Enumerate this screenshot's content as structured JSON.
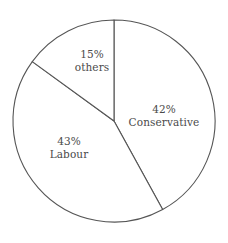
{
  "chart_data": {
    "type": "pie",
    "title": "",
    "subtitle": "",
    "xlabel": "",
    "ylabel": "",
    "legend_position": "none",
    "grid": false,
    "total": 100,
    "units": "percent",
    "start_angle_deg": 0,
    "direction": "clockwise",
    "geometry": {
      "center_x": 114,
      "center_y": 121,
      "radius": 101
    },
    "style": {
      "slice_fill": "#ffffff",
      "slice_stroke": "#555555",
      "label_color": "#4a4a4a",
      "background": "#ffffff"
    },
    "categories": [
      "Conservative",
      "Labour",
      "others"
    ],
    "values": [
      42,
      43,
      15
    ],
    "slices": [
      {
        "name": "Conservative",
        "value": 42,
        "percent_label": "42%",
        "label_line1": "42%",
        "label_line2": "Conservative",
        "start_deg": 0,
        "end_deg": 151.2,
        "label_x": 164,
        "label_y": 115
      },
      {
        "name": "Labour",
        "value": 43,
        "percent_label": "43%",
        "label_line1": "43%",
        "label_line2": "Labour",
        "start_deg": 151.2,
        "end_deg": 306.0,
        "label_x": 69,
        "label_y": 147
      },
      {
        "name": "others",
        "value": 15,
        "percent_label": "15%",
        "label_line1": "15%",
        "label_line2": "others",
        "start_deg": 306.0,
        "end_deg": 360.0,
        "label_x": 92,
        "label_y": 60
      }
    ]
  }
}
